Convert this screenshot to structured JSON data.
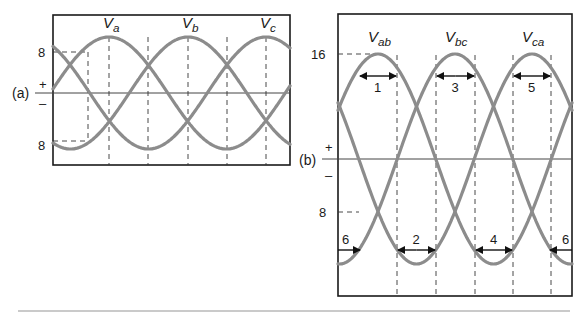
{
  "diagram_a": {
    "panel_label": "(a)",
    "plus_sign": "+",
    "minus_sign": "–",
    "peak_value_label": "8",
    "trough_value_label": "8",
    "waves": [
      {
        "name": "V",
        "subscript": "a",
        "peak_x": 109
      },
      {
        "name": "V",
        "subscript": "b",
        "peak_x": 188
      },
      {
        "name": "V",
        "subscript": "c",
        "peak_x": 266
      }
    ]
  },
  "diagram_b": {
    "panel_label": "(b)",
    "plus_sign": "+",
    "minus_sign": "–",
    "peak_value_label": "16",
    "mid_value_label": "8",
    "waves": [
      {
        "name": "V",
        "subscript": "ab",
        "peak_x": 378
      },
      {
        "name": "V",
        "subscript": "bc",
        "peak_x": 455
      },
      {
        "name": "V",
        "subscript": "ca",
        "peak_x": 532
      }
    ],
    "intervals_top": [
      {
        "label": "1",
        "x1": 359,
        "x2": 397
      },
      {
        "label": "3",
        "x1": 436,
        "x2": 475
      },
      {
        "label": "5",
        "x1": 513,
        "x2": 551
      }
    ],
    "intervals_bottom": [
      {
        "label": "2",
        "x1": 397,
        "x2": 436
      },
      {
        "label": "4",
        "x1": 475,
        "x2": 513
      },
      {
        "label": "6",
        "x1": 338,
        "x2": 359,
        "dir": "right"
      },
      {
        "label": "6",
        "x1": 551,
        "x2": 572,
        "dir": "left"
      }
    ]
  }
}
